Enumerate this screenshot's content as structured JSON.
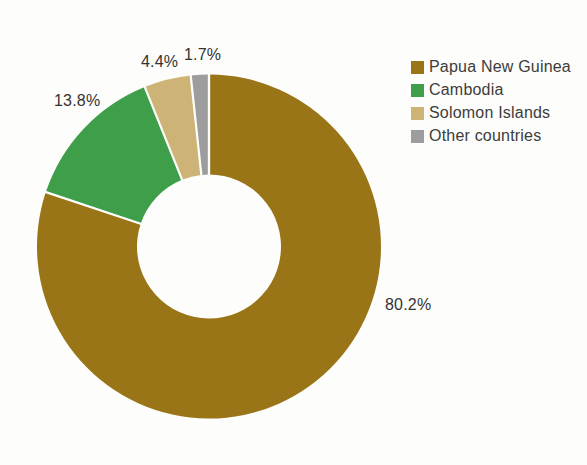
{
  "chart_data": {
    "type": "pie",
    "subtype": "donut",
    "title": "",
    "slices": [
      {
        "name": "Papua New Guinea",
        "value": 80.2,
        "label": "80.2%",
        "color": "#9A7517"
      },
      {
        "name": "Cambodia",
        "value": 13.8,
        "label": "13.8%",
        "color": "#3E9E4A"
      },
      {
        "name": "Solomon Islands",
        "value": 4.4,
        "label": "4.4%",
        "color": "#CDB476"
      },
      {
        "name": "Other countries",
        "value": 1.7,
        "label": "1.7%",
        "color": "#9D9D9D"
      }
    ],
    "start_angle_deg": 0,
    "direction": "clockwise",
    "legend_position": "right",
    "slice_separator_color": "#FFFFFF",
    "label_color": "#333333"
  }
}
